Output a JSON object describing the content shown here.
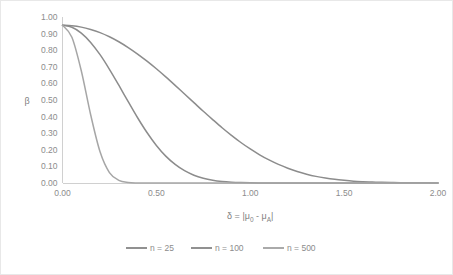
{
  "chart_data": {
    "type": "line",
    "title": "",
    "xlabel": "δ = |μ0 - μA|",
    "ylabel": "β",
    "xlim": [
      0,
      2
    ],
    "ylim": [
      0,
      1
    ],
    "grid": false,
    "legend_position": "bottom",
    "x_ticks": [
      "0.00",
      "0.50",
      "1.00",
      "1.50",
      "2.00"
    ],
    "x_tick_values": [
      0,
      0.5,
      1,
      1.5,
      2
    ],
    "y_ticks": [
      "0.00",
      "0.10",
      "0.20",
      "0.30",
      "0.40",
      "0.50",
      "0.60",
      "0.70",
      "0.80",
      "0.90",
      "1.00"
    ],
    "y_tick_values": [
      0,
      0.1,
      0.2,
      0.3,
      0.4,
      0.5,
      0.6,
      0.7,
      0.8,
      0.9,
      1.0
    ],
    "x": [
      0,
      0.05,
      0.1,
      0.15,
      0.2,
      0.25,
      0.3,
      0.35,
      0.4,
      0.45,
      0.5,
      0.55,
      0.6,
      0.65,
      0.7,
      0.75,
      0.8,
      0.85,
      0.9,
      0.95,
      1.0,
      1.05,
      1.1,
      1.15,
      1.2,
      1.25,
      1.3,
      1.35,
      1.4,
      1.45,
      1.5,
      1.55,
      1.6,
      1.65,
      1.7,
      1.75,
      1.8,
      1.85,
      1.9,
      1.95,
      2.0
    ],
    "series": [
      {
        "name": "n = 25",
        "color": "#8c8c8c",
        "values": [
          0.95,
          0.947,
          0.939,
          0.925,
          0.906,
          0.881,
          0.851,
          0.816,
          0.777,
          0.734,
          0.688,
          0.639,
          0.588,
          0.536,
          0.484,
          0.432,
          0.382,
          0.333,
          0.287,
          0.244,
          0.205,
          0.17,
          0.139,
          0.112,
          0.089,
          0.069,
          0.053,
          0.04,
          0.03,
          0.022,
          0.016,
          0.011,
          0.008,
          0.006,
          0.004,
          0.003,
          0.002,
          0.0015,
          0.001,
          0.0008,
          0.0005
        ]
      },
      {
        "name": "n = 100",
        "color": "#8c8c8c",
        "values": [
          0.95,
          0.938,
          0.903,
          0.847,
          0.773,
          0.685,
          0.589,
          0.49,
          0.393,
          0.304,
          0.226,
          0.162,
          0.112,
          0.074,
          0.047,
          0.029,
          0.017,
          0.0095,
          0.0051,
          0.0026,
          0.0013,
          0.0006,
          0.0003,
          0.00012,
          5e-05,
          2e-05,
          1e-05,
          0,
          0,
          0,
          0,
          0,
          0,
          0,
          0,
          0,
          0,
          0,
          0,
          0,
          0
        ]
      },
      {
        "name": "n = 500",
        "color": "#a6a6a6",
        "values": [
          0.95,
          0.878,
          0.676,
          0.411,
          0.188,
          0.063,
          0.016,
          0.003,
          0.0004,
          4e-05,
          0,
          0,
          0,
          0,
          0,
          0,
          0,
          0,
          0,
          0,
          0,
          0,
          0,
          0,
          0,
          0,
          0,
          0,
          0,
          0,
          0,
          0,
          0,
          0,
          0,
          0,
          0,
          0,
          0,
          0,
          0
        ]
      }
    ]
  },
  "axis": {
    "y_title": "β",
    "x_title_parts": {
      "delta": "δ",
      "equals": " = ",
      "bar_open": "|",
      "mu1": "μ",
      "sub1": "0",
      "minus": " - ",
      "mu2": "μ",
      "sub2": "A",
      "bar_close": "|"
    }
  },
  "legend": {
    "items": [
      {
        "label": "n = 25",
        "color": "#8c8c8c"
      },
      {
        "label": "n = 100",
        "color": "#8c8c8c"
      },
      {
        "label": "n = 500",
        "color": "#a6a6a6"
      }
    ]
  },
  "colors": {
    "axis": "#d0d0d0",
    "text": "#8c8c8c",
    "border": "#e8e8e8",
    "background": "#ffffff"
  }
}
